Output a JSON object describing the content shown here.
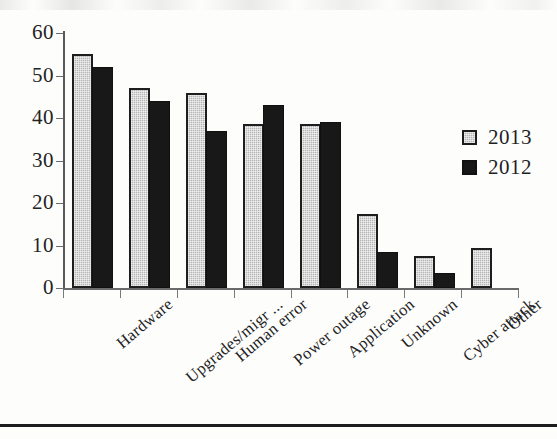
{
  "chart_data": {
    "type": "bar",
    "title": "",
    "subtitle": "",
    "xlabel": "",
    "ylabel": "",
    "ylim": [
      0,
      60
    ],
    "yticks": [
      0,
      10,
      20,
      30,
      40,
      50,
      60
    ],
    "grid": false,
    "legend_position": "right",
    "categories": [
      "Hardware",
      "Upgrades/migr ...",
      "Human error",
      "Power outage",
      "Application",
      "Unknown",
      "Cyber attack",
      "Other"
    ],
    "series": [
      {
        "name": "2013",
        "color": "#b4b4b4",
        "values": [
          55,
          47,
          46,
          38.5,
          38.5,
          17.5,
          7.5,
          9.5
        ]
      },
      {
        "name": "2012",
        "color": "#181818",
        "values": [
          52,
          44,
          37,
          43,
          39,
          8.5,
          3.5,
          null
        ]
      }
    ]
  },
  "legend": {
    "entries": [
      {
        "label": "2013",
        "swatch": "light-gray-square"
      },
      {
        "label": "2012",
        "swatch": "black-square"
      }
    ]
  },
  "axis": {
    "y_tick_labels": [
      "60",
      "50",
      "40",
      "30",
      "20",
      "10",
      "0"
    ]
  }
}
